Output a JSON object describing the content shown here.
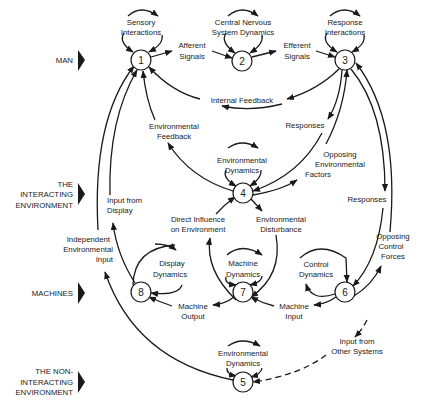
{
  "levels": [
    {
      "id": "man",
      "lines": [
        "MAN"
      ]
    },
    {
      "id": "interacting",
      "lines": [
        "THE",
        "INTERACTING",
        "ENVIRONMENT"
      ]
    },
    {
      "id": "machines",
      "lines": [
        "MACHINES"
      ]
    },
    {
      "id": "non-interacting",
      "lines": [
        "THE  NON-",
        "INTERACTING",
        "ENVIRONMENT"
      ]
    }
  ],
  "nodes": [
    {
      "id": "1",
      "label": "1"
    },
    {
      "id": "2",
      "label": "2"
    },
    {
      "id": "3",
      "label": "3"
    },
    {
      "id": "4",
      "label": "4"
    },
    {
      "id": "5",
      "label": "5"
    },
    {
      "id": "6",
      "label": "6"
    },
    {
      "id": "7",
      "label": "7"
    },
    {
      "id": "8",
      "label": "8"
    }
  ],
  "self_loops": {
    "n1": [
      "Sensory",
      "Interactions"
    ],
    "n2": [
      "Central Nervous",
      "System Dynamics"
    ],
    "n3": [
      "Response",
      "Interactions"
    ],
    "n4": [
      "Environmental",
      "Dynamics"
    ],
    "n8": [
      "Display",
      "Dynamics"
    ],
    "n7": [
      "Machine",
      "Dynamics"
    ],
    "n6": [
      "Control",
      "Dynamics"
    ],
    "n5": [
      "Environmental",
      "Dynamics"
    ]
  },
  "edges": {
    "afferent": [
      "Afferent",
      "Signals"
    ],
    "efferent": [
      "Efferent",
      "Signals"
    ],
    "internal_feedback": [
      "Internal Feedback"
    ],
    "env_feedback": [
      "Environmental",
      "Feedback"
    ],
    "responses_3_4": [
      "Responses"
    ],
    "opposing_env": [
      "Opposing",
      "Environmental",
      "Factors"
    ],
    "responses_3_6": [
      "Responses"
    ],
    "opposing_control": [
      "Opposing",
      "Control",
      "Forces"
    ],
    "input_from_display": [
      "Input from",
      "Display"
    ],
    "independent_env": [
      "Independent",
      "Environmental",
      "Input"
    ],
    "direct_influence": [
      "Direct Influence",
      "on Environment"
    ],
    "env_disturbance": [
      "Environmental",
      "Disturbance"
    ],
    "machine_output": [
      "Machine",
      "Output"
    ],
    "machine_input": [
      "Machine",
      "Input"
    ],
    "other_systems": [
      "Input from",
      "Other Systems"
    ]
  }
}
